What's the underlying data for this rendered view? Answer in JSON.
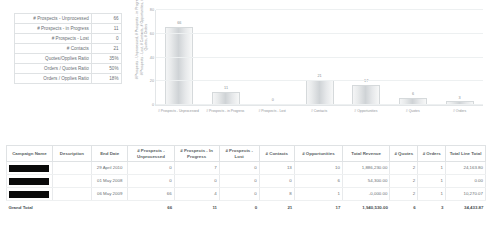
{
  "summary": {
    "rows": [
      {
        "label": "# Prospects - Unprocessed",
        "value": "66"
      },
      {
        "label": "# Prospects - in Progress",
        "value": "11"
      },
      {
        "label": "# Prospects - Lost",
        "value": "0"
      },
      {
        "label": "# Contacts",
        "value": "21"
      },
      {
        "label": "Quotes/Opplies Ratio",
        "value": "35%"
      },
      {
        "label": "Orders / Quotes Ratio",
        "value": "50%"
      },
      {
        "label": "Orders / Opplies Ratio",
        "value": "18%"
      }
    ]
  },
  "chart_data": {
    "type": "bar",
    "title": "",
    "xlabel": "",
    "ylabel": "# Prospects - Unprocessed, # Prospects - in Progress, # Prospects - Lost, # Contacts, # Opportunities, # Quotes, # Orders",
    "categories": [
      "# Prospects - Unprocessed",
      "# Prospects - in Progress",
      "# Prospects - Lost",
      "# Contacts",
      "# Opportunities",
      "# Quotes",
      "# Orders"
    ],
    "values": [
      66,
      11,
      0,
      21,
      17,
      6,
      3
    ],
    "value_labels": [
      "66",
      "11",
      "0",
      "21",
      "17",
      "6",
      "3"
    ],
    "ylim": [
      0,
      80
    ],
    "yticks": [
      0,
      20,
      40,
      60,
      80
    ],
    "ytick_labels": [
      "0",
      "20",
      "40",
      "60",
      "80"
    ],
    "grid": true,
    "legend": "none"
  },
  "detail": {
    "headers": [
      "Campaign Name",
      "Description",
      "End Date",
      "# Prospects - Unprocessed",
      "# Prospects - In Progress",
      "# Prospects - Lost",
      "# Contacts",
      "# Opportunities",
      "Total Revenue",
      "# Quotes",
      "# Orders",
      "Total Line Total"
    ],
    "rows": [
      {
        "name": "",
        "description": "",
        "end_date": "29 April 2010",
        "unprocessed": "0",
        "in_progress": "7",
        "lost": "0",
        "contacts": "13",
        "opportunities": "10",
        "revenue": "1,886,230.00",
        "quotes": "2",
        "orders": "1",
        "line_total": "24,163.80"
      },
      {
        "name": "",
        "description": "",
        "end_date": "01 May 2008",
        "unprocessed": "0",
        "in_progress": "0",
        "lost": "0",
        "contacts": "0",
        "opportunities": "6",
        "revenue": "54,300.00",
        "quotes": "2",
        "orders": "1",
        "line_total": "0.00"
      },
      {
        "name": "",
        "description": "",
        "end_date": "06 May 2009",
        "unprocessed": "66",
        "in_progress": "4",
        "lost": "0",
        "contacts": "8",
        "opportunities": "1",
        "revenue": "-0,000.00",
        "quotes": "2",
        "orders": "1",
        "line_total": "10,270.07"
      }
    ],
    "grand_total": {
      "label": "Grand Total",
      "description": "",
      "end_date": "",
      "unprocessed": "66",
      "in_progress": "11",
      "lost": "0",
      "contacts": "21",
      "opportunities": "17",
      "revenue": "1,940,530.00",
      "quotes": "6",
      "orders": "3",
      "line_total": "34,433.87"
    }
  }
}
